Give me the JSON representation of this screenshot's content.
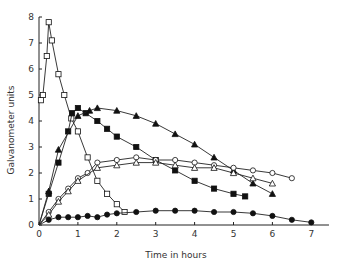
{
  "chart_data": {
    "type": "line",
    "title": "",
    "xlabel": "Time in hours",
    "ylabel": "Galvanometer units",
    "xlim": [
      0,
      7.3
    ],
    "ylim": [
      0,
      8
    ],
    "xticks": [
      0,
      1,
      2,
      3,
      4,
      5,
      6,
      7
    ],
    "yticks": [
      0,
      1,
      2,
      3,
      4,
      5,
      6,
      7,
      8
    ],
    "grid": false,
    "legend": "none",
    "series": [
      {
        "name": "open squares",
        "marker": "square-open",
        "x": [
          0.05,
          0.1,
          0.2,
          0.25,
          0.33,
          0.5,
          0.65,
          0.83,
          1.0,
          1.25,
          1.5,
          1.75,
          2.0,
          2.2
        ],
        "y": [
          4.8,
          5.0,
          6.5,
          7.8,
          7.1,
          5.8,
          5.0,
          4.1,
          3.6,
          2.6,
          1.7,
          1.2,
          0.8,
          0.5
        ]
      },
      {
        "name": "filled squares",
        "marker": "square-filled",
        "x": [
          0,
          0.25,
          0.5,
          0.75,
          0.85,
          1.0,
          1.2,
          1.5,
          1.75,
          2.0,
          2.5,
          3.0,
          3.5,
          4.0,
          4.5,
          5.0,
          5.3
        ],
        "y": [
          0,
          1.2,
          2.4,
          3.6,
          4.3,
          4.5,
          4.3,
          4.0,
          3.7,
          3.4,
          3.0,
          2.5,
          2.1,
          1.7,
          1.4,
          1.2,
          1.1
        ]
      },
      {
        "name": "filled triangles",
        "marker": "triangle-filled",
        "x": [
          0,
          0.25,
          0.5,
          1.0,
          1.3,
          1.5,
          2.0,
          2.5,
          3.0,
          3.5,
          4.0,
          4.5,
          5.0,
          5.5,
          6.0
        ],
        "y": [
          0,
          1.3,
          2.9,
          4.2,
          4.4,
          4.5,
          4.4,
          4.2,
          3.9,
          3.5,
          3.1,
          2.6,
          2.1,
          1.6,
          1.2
        ]
      },
      {
        "name": "open circles",
        "marker": "circle-open",
        "x": [
          0,
          0.25,
          0.5,
          0.75,
          1.0,
          1.25,
          1.5,
          2.0,
          2.5,
          3.0,
          3.5,
          4.0,
          4.5,
          5.0,
          5.5,
          6.0,
          6.5
        ],
        "y": [
          0,
          0.5,
          1.0,
          1.4,
          1.8,
          2.0,
          2.4,
          2.5,
          2.6,
          2.5,
          2.5,
          2.4,
          2.3,
          2.2,
          2.1,
          2.0,
          1.8
        ]
      },
      {
        "name": "open triangles",
        "marker": "triangle-open",
        "x": [
          0,
          0.25,
          0.5,
          0.75,
          1.0,
          1.5,
          2.0,
          2.5,
          3.0,
          3.5,
          4.0,
          4.5,
          5.0,
          5.5,
          6.0
        ],
        "y": [
          0,
          0.4,
          0.9,
          1.3,
          1.7,
          2.2,
          2.3,
          2.4,
          2.4,
          2.3,
          2.2,
          2.2,
          2.0,
          1.8,
          1.6
        ]
      },
      {
        "name": "filled circles",
        "marker": "circle-filled",
        "x": [
          0,
          0.25,
          0.5,
          0.75,
          1.0,
          1.25,
          1.5,
          1.75,
          2.0,
          2.5,
          3.0,
          3.5,
          4.0,
          4.5,
          5.0,
          5.5,
          6.0,
          6.5,
          7.0
        ],
        "y": [
          0,
          0.2,
          0.3,
          0.3,
          0.3,
          0.35,
          0.3,
          0.4,
          0.45,
          0.5,
          0.55,
          0.55,
          0.55,
          0.5,
          0.5,
          0.45,
          0.35,
          0.2,
          0.1
        ]
      }
    ]
  }
}
